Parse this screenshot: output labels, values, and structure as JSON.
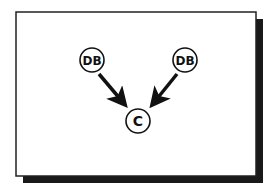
{
  "diagram": {
    "nodes": [
      {
        "id": "db1",
        "label": "DB",
        "cx": 92,
        "cy": 60
      },
      {
        "id": "db2",
        "label": "DB",
        "cx": 185,
        "cy": 60
      },
      {
        "id": "c",
        "label": "C",
        "cx": 138,
        "cy": 121
      }
    ],
    "edges": [
      {
        "from": "db1",
        "to": "c"
      },
      {
        "from": "db2",
        "to": "c"
      }
    ],
    "colors": {
      "stroke": "#111111",
      "shadow": "#1a1a1a",
      "background": "#ffffff"
    }
  }
}
